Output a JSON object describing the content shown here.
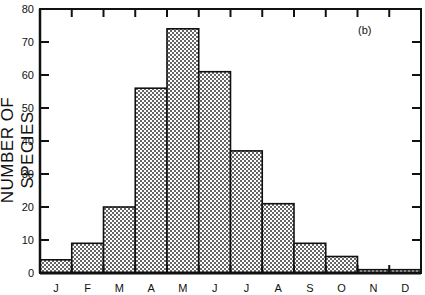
{
  "chart_data": {
    "type": "bar",
    "title": "",
    "panel_label": "(b)",
    "xlabel": "",
    "ylabel": "NUMBER OF SPECIES",
    "categories": [
      "J",
      "F",
      "M",
      "A",
      "M",
      "J",
      "J",
      "A",
      "S",
      "O",
      "N",
      "D"
    ],
    "values": [
      4,
      9,
      20,
      56,
      74,
      61,
      37,
      21,
      9,
      5,
      1,
      1
    ],
    "ylim": [
      0,
      80
    ],
    "yticks": [
      0,
      10,
      20,
      30,
      40,
      50,
      60,
      70,
      80
    ],
    "grid": false,
    "legend": null,
    "bar_fill": "checkered-pattern",
    "histogram": true
  },
  "colors": {
    "axis": "#111111",
    "bar_pattern_dark": "#555555",
    "bar_pattern_light": "#ffffff"
  }
}
